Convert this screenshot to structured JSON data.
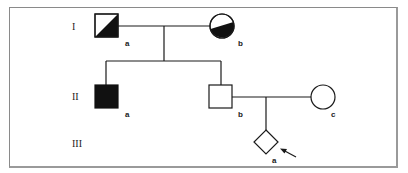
{
  "diagram": {
    "type": "pedigree",
    "colors": {
      "line": "#1a1a1a",
      "affected": "#111111",
      "frame": "#8a8a8a"
    },
    "generations": [
      {
        "label": "I"
      },
      {
        "label": "II"
      },
      {
        "label": "III"
      }
    ],
    "individuals": {
      "I_a": {
        "label": "a",
        "shape": "square",
        "status": "half-affected-diagonal"
      },
      "I_b": {
        "label": "b",
        "shape": "circle",
        "status": "half-affected"
      },
      "II_a": {
        "label": "a",
        "shape": "square",
        "status": "affected"
      },
      "II_b": {
        "label": "b",
        "shape": "square",
        "status": "unaffected"
      },
      "II_c": {
        "label": "c",
        "shape": "circle",
        "status": "unaffected"
      },
      "III_a": {
        "label": "a",
        "shape": "diamond",
        "status": "unaffected",
        "proband": true
      }
    }
  }
}
